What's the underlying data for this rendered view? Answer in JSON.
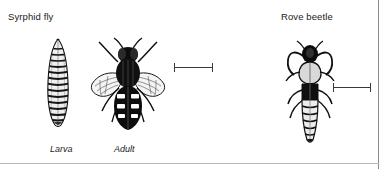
{
  "figure": {
    "background_color": "#ffffff",
    "border_color": "#8a8a8a",
    "ink_color": "#1b1b1b",
    "headings": {
      "syrphid_fly": "Syrphid fly",
      "rove_beetle": "Rove beetle"
    },
    "captions": {
      "larva": "Larva",
      "adult": "Adult"
    },
    "illustrations": [
      {
        "name": "syrphid-larva",
        "caption": "Larva",
        "group": "Syrphid fly",
        "description": "segmented tapered maggot, dorsal view"
      },
      {
        "name": "syrphid-adult",
        "caption": "Adult",
        "group": "Syrphid fly",
        "description": "hoverfly with spread wings and banded abdomen, dorsal view"
      },
      {
        "name": "rove-beetle",
        "caption": "",
        "group": "Rove beetle",
        "description": "rove beetle with curved mandibles and segmented abdomen, dorsal view"
      }
    ],
    "scale_bars": [
      {
        "name": "scale-bar-fly",
        "label": ""
      },
      {
        "name": "scale-bar-beetle",
        "label": ""
      }
    ]
  }
}
